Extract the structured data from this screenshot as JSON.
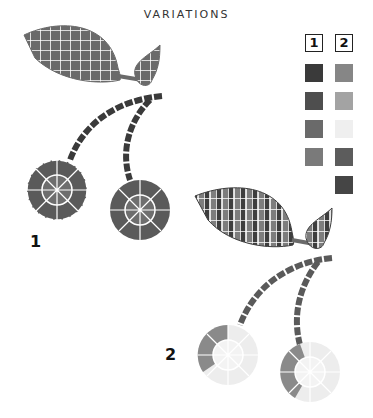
{
  "title": "VARIATIONS",
  "legend": {
    "columns": [
      {
        "label": "1",
        "swatches": [
          "#3a3a3a",
          "#4e4e4e",
          "#6a6a6a",
          "#7a7a7a"
        ]
      },
      {
        "label": "2",
        "swatches": [
          "#868686",
          "#a3a3a3",
          "#efefef",
          "#5c5c5c",
          "#454545"
        ]
      }
    ]
  },
  "variations": [
    {
      "label": "1"
    },
    {
      "label": "2"
    }
  ]
}
